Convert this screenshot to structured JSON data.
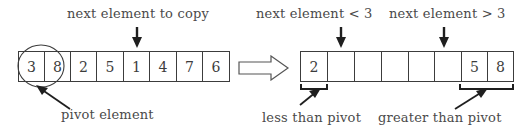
{
  "figure": {
    "type": "algorithm-diagram",
    "topic": "quicksort partition step"
  },
  "left_panel": {
    "top_label": "next element to copy",
    "bottom_label": "pivot element",
    "array": {
      "values": [
        "3",
        "8",
        "2",
        "5",
        "1",
        "4",
        "7",
        "6"
      ]
    },
    "pointer_index": 4,
    "circled_index": 0
  },
  "transform_arrow": {
    "name": "right-block-arrow"
  },
  "right_panel": {
    "top_label_left": "next element < 3",
    "top_label_right": "next element > 3",
    "bottom_label_left": "less than pivot",
    "bottom_label_right": "greater than pivot",
    "array": {
      "values": [
        "2",
        "",
        "",
        "",
        "",
        "",
        "5",
        "8"
      ]
    },
    "pointer_index_left": 1,
    "pointer_index_right": 5,
    "bracket_left_cells": [
      0
    ],
    "bracket_right_cells": [
      6,
      7
    ]
  },
  "colors": {
    "ink": "#3c3c3c",
    "text": "#4a4a4a",
    "background": "#ffffff"
  }
}
